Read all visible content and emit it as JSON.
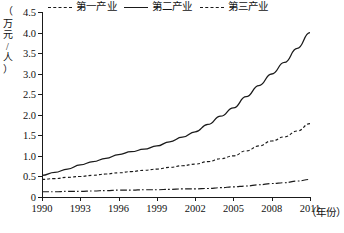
{
  "chart_data": {
    "type": "line",
    "title": "",
    "xlabel": "(年份)",
    "ylabel": "(万元/人)",
    "xlim": [
      1990,
      2011
    ],
    "ylim": [
      0,
      4.5
    ],
    "grid": false,
    "legend_position": "top",
    "x_tick_labels": [
      "1990",
      "1993",
      "1996",
      "1999",
      "2002",
      "2005",
      "2008",
      "2011"
    ],
    "x_ticks": [
      1990,
      1993,
      1996,
      1999,
      2002,
      2005,
      2008,
      2011
    ],
    "y_tick_labels": [
      "0",
      "0.5",
      "1.0",
      "1.5",
      "2.0",
      "2.5",
      "3.0",
      "3.5",
      "4.0",
      "4.5"
    ],
    "y_ticks": [
      0,
      0.5,
      1.0,
      1.5,
      2.0,
      2.5,
      3.0,
      3.5,
      4.0,
      4.5
    ],
    "x": [
      1990,
      1991,
      1992,
      1993,
      1994,
      1995,
      1996,
      1997,
      1998,
      1999,
      2000,
      2001,
      2002,
      2003,
      2004,
      2005,
      2006,
      2007,
      2008,
      2009,
      2010,
      2011
    ],
    "series": [
      {
        "name": "第一产业",
        "style": "dash-dot",
        "values": [
          0.15,
          0.15,
          0.16,
          0.16,
          0.17,
          0.18,
          0.19,
          0.19,
          0.2,
          0.2,
          0.21,
          0.22,
          0.22,
          0.23,
          0.25,
          0.27,
          0.29,
          0.32,
          0.35,
          0.37,
          0.41,
          0.45
        ]
      },
      {
        "name": "第二产业",
        "style": "solid",
        "values": [
          0.55,
          0.62,
          0.7,
          0.8,
          0.88,
          0.96,
          1.05,
          1.12,
          1.18,
          1.26,
          1.36,
          1.47,
          1.6,
          1.78,
          1.98,
          2.18,
          2.45,
          2.72,
          3.0,
          3.28,
          3.62,
          4.0
        ]
      },
      {
        "name": "第三产业",
        "style": "dashed",
        "values": [
          0.45,
          0.47,
          0.5,
          0.52,
          0.55,
          0.58,
          0.61,
          0.64,
          0.67,
          0.7,
          0.74,
          0.78,
          0.82,
          0.88,
          0.95,
          1.02,
          1.14,
          1.26,
          1.38,
          1.48,
          1.62,
          1.8
        ]
      }
    ]
  },
  "axis": {
    "y_title_chars": [
      "（",
      "万",
      "元",
      "/",
      "人",
      "）"
    ],
    "x_title": "（年份）"
  },
  "legend": {
    "items": [
      {
        "label": "第一产业",
        "style": "dash-dot"
      },
      {
        "label": "第二产业",
        "style": "solid"
      },
      {
        "label": "第三产业",
        "style": "dashed"
      }
    ]
  }
}
